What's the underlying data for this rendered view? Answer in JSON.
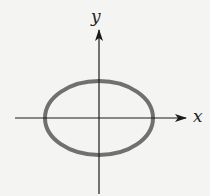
{
  "diagram": {
    "type": "ellipse-on-axes",
    "axes": {
      "x_label": "x",
      "y_label": "y",
      "origin": [
        99,
        118
      ],
      "color": "#1a1a1a"
    },
    "ellipse": {
      "center": [
        99,
        118
      ],
      "rx": 54,
      "ry": 37,
      "stroke": "#707070"
    }
  }
}
